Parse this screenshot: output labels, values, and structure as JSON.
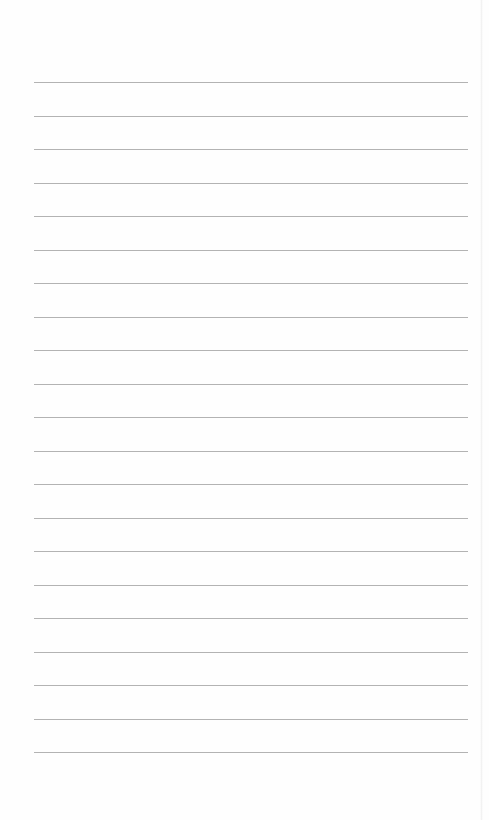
{
  "page": {
    "type": "lined-paper",
    "background": "#fefefe",
    "rule_color": "#9a9a9a",
    "rule_count": 21,
    "first_rule_y": 82,
    "rule_spacing": 33.5,
    "rule_left": 34,
    "rule_width": 434,
    "text": ""
  }
}
